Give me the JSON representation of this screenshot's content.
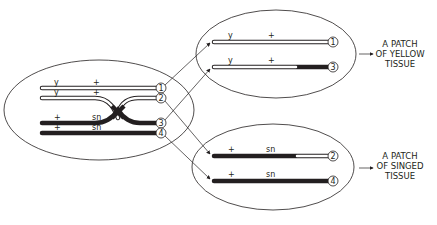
{
  "diagram": {
    "parent_cell": {
      "chromosomes": [
        {
          "id": "1",
          "left_label": "y",
          "right_label": "+"
        },
        {
          "id": "2",
          "left_label": "y",
          "right_label": "+"
        },
        {
          "id": "3",
          "left_label": "+",
          "right_label": "sn"
        },
        {
          "id": "4",
          "left_label": "+",
          "right_label": "sn"
        }
      ]
    },
    "daughter_top": {
      "chromosomes": [
        {
          "id": "1",
          "left_label": "y",
          "right_label": "+"
        },
        {
          "id": "3",
          "left_label": "y",
          "right_label": "+"
        }
      ],
      "result": [
        "A PATCH",
        "OF YELLOW",
        "TISSUE"
      ]
    },
    "daughter_bottom": {
      "chromosomes": [
        {
          "id": "2",
          "left_label": "+",
          "right_label": "sn"
        },
        {
          "id": "4",
          "left_label": "+",
          "right_label": "sn"
        }
      ],
      "result": [
        "A PATCH",
        "OF SINGED",
        "TISSUE"
      ]
    },
    "colors": {
      "line": "#231f20",
      "fill": "#ffffff"
    }
  }
}
